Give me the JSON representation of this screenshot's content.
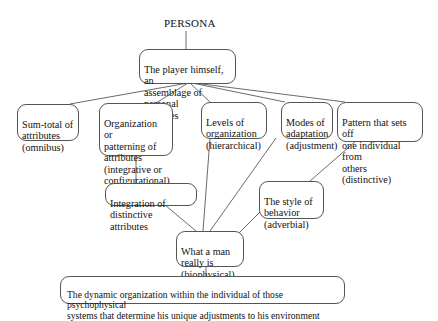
{
  "diagram": {
    "title": "PERSONA",
    "nodes": {
      "player": "The player himself, an\nassemblage of personal\nqualities",
      "sum_total": "Sum-total of\nattributes\n(omnibus)",
      "organization": "Organization or\npatterning of\nattributes\n(integrative or\nconfigurational)",
      "levels": "Levels of\norganization\n(hierarchical)",
      "modes": "Modes of\nadaptation\n(adjustment)",
      "pattern": "Pattern that sets off\none individual from\nothers (distinctive)",
      "integration": "Integration of\ndistinctive attributes",
      "style": "The style of\nbehavior\n(adverbial)",
      "what_a_man": "What a man\nreally is\n(biophysical)",
      "dynamic": "The dynamic organization within the individual of those psychophysical\nsystems that determine his unique adjustments to his environment"
    },
    "edges": [
      [
        "title",
        "player"
      ],
      [
        "player",
        "sum_total"
      ],
      [
        "player",
        "organization"
      ],
      [
        "player",
        "levels"
      ],
      [
        "player",
        "modes"
      ],
      [
        "player",
        "pattern"
      ],
      [
        "organization",
        "integration"
      ],
      [
        "integration",
        "what_a_man"
      ],
      [
        "levels",
        "what_a_man"
      ],
      [
        "modes",
        "what_a_man"
      ],
      [
        "pattern",
        "style"
      ],
      [
        "style",
        "what_a_man"
      ],
      [
        "what_a_man",
        "dynamic"
      ]
    ]
  }
}
